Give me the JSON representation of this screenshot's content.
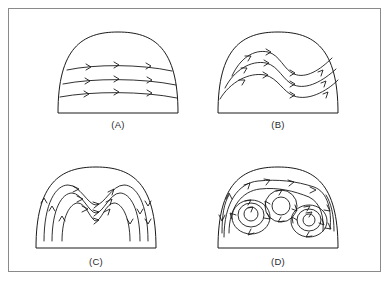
{
  "figure": {
    "background_color": "#ffffff",
    "border_color": "#8a8a8a",
    "line_color": "#1a1a1a",
    "panels": [
      {
        "id": "a",
        "label": "(A)",
        "regime": "laminar-horizontal-flow",
        "description": "Semicircular dome with three nearly horizontal streamlines flowing left to right",
        "streamline_count": 3,
        "arrow_count": 9,
        "arrow_direction": "rightward"
      },
      {
        "id": "b",
        "label": "(B)",
        "regime": "wavy-flow",
        "description": "Semicircular dome with three wavy S-shaped streamlines rising at left, dipping at center, descending at right",
        "streamline_count": 3,
        "arrow_count": 12,
        "arrow_direction": "rightward-along-wave"
      },
      {
        "id": "c",
        "label": "(C)",
        "regime": "folded-flow",
        "description": "Semicircular dome with strongly folded inverted-V streamlines forming a deep central valley",
        "streamline_count": 3,
        "arrow_count": 16,
        "arrow_direction": "up-left-flank-down-right-flank"
      },
      {
        "id": "d",
        "label": "(D)",
        "regime": "turbulent-vortex-cells",
        "description": "Semicircular dome containing three closed circulating vortex cells enclosed by an outer streamline",
        "vortex_count": 3,
        "arrow_count": 22,
        "arrow_direction": "circulating"
      }
    ]
  }
}
